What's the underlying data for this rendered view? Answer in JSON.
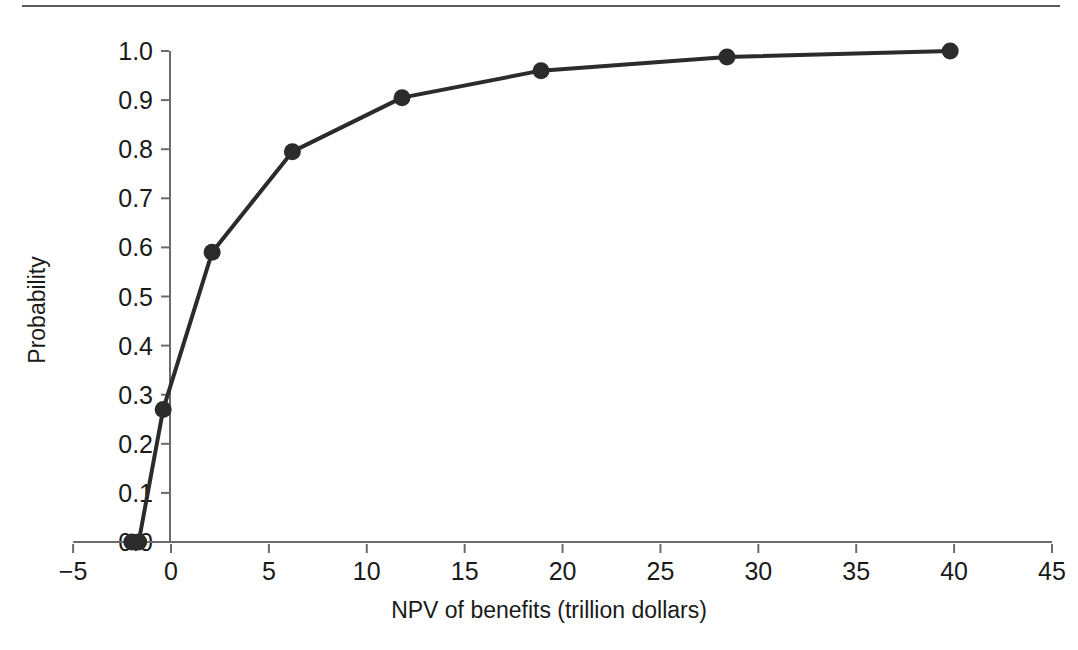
{
  "figure": {
    "background_color": "#ffffff",
    "rule_color": "#5a5a5a",
    "ink_color": "#2b2b2b"
  },
  "chart_data": {
    "type": "line",
    "title": "",
    "subtitle": "",
    "xlabel": "NPV of benefits (trillion dollars)",
    "ylabel": "Probability",
    "xlim": [
      -5,
      45
    ],
    "ylim": [
      0.0,
      1.0
    ],
    "xticks": [
      -5,
      0,
      5,
      10,
      15,
      20,
      25,
      30,
      35,
      40,
      45
    ],
    "xtick_labels": [
      "−5",
      "0",
      "5",
      "10",
      "15",
      "20",
      "25",
      "30",
      "35",
      "40",
      "45"
    ],
    "yticks": [
      0.0,
      0.1,
      0.2,
      0.3,
      0.4,
      0.5,
      0.6,
      0.7,
      0.8,
      0.9,
      1.0
    ],
    "ytick_labels": [
      "0.0",
      "0.1",
      "0.2",
      "0.3",
      "0.4",
      "0.5",
      "0.6",
      "0.7",
      "0.8",
      "0.9",
      "1.0"
    ],
    "grid": false,
    "legend": null,
    "marker": "filled-circle",
    "marker_size": 17,
    "line_width": 4,
    "line_color": "#2b2b2b",
    "marker_color": "#2b2b2b",
    "x": [
      -2.0,
      -1.65,
      -0.4,
      2.1,
      6.2,
      11.8,
      18.9,
      28.4,
      39.8
    ],
    "y": [
      0.0,
      0.0,
      0.27,
      0.59,
      0.795,
      0.905,
      0.96,
      0.988,
      1.0
    ],
    "series": [
      {
        "name": "Cumulative probability of NPV of benefits",
        "points": [
          {
            "x": -2.0,
            "y": 0.0
          },
          {
            "x": -1.65,
            "y": 0.0
          },
          {
            "x": -0.4,
            "y": 0.27
          },
          {
            "x": 2.1,
            "y": 0.59
          },
          {
            "x": 6.2,
            "y": 0.795
          },
          {
            "x": 11.8,
            "y": 0.905
          },
          {
            "x": 18.9,
            "y": 0.96
          },
          {
            "x": 28.4,
            "y": 0.988
          },
          {
            "x": 39.8,
            "y": 1.0
          }
        ]
      }
    ]
  }
}
